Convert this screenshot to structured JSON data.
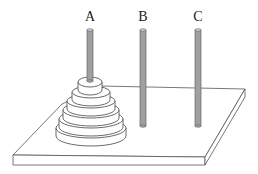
{
  "pegs": [
    {
      "label": "A",
      "x": 88,
      "disks": 6
    },
    {
      "label": "B",
      "x": 143,
      "disks": 0
    },
    {
      "label": "C",
      "x": 198,
      "disks": 0
    }
  ],
  "colors": {
    "peg": "#a0a0a0",
    "peg_outline": "#555555",
    "line": "#444444",
    "fill": "#ffffff"
  }
}
